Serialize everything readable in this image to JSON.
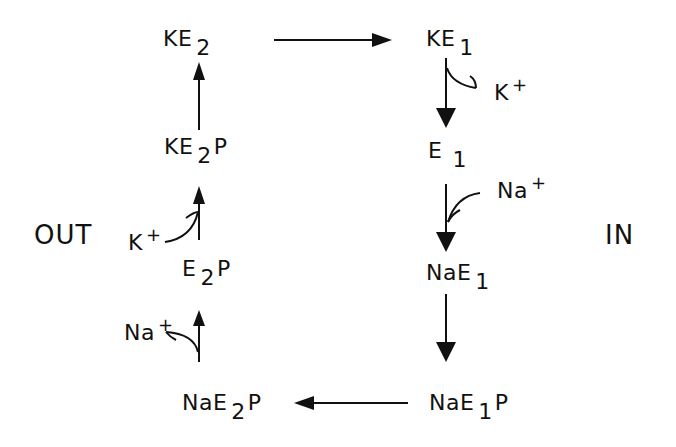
{
  "diagram": {
    "type": "reaction-cycle",
    "compartments": {
      "left": "OUT",
      "right": "IN"
    },
    "states": {
      "ke2": {
        "base": "KE",
        "sub": "2",
        "suffix": ""
      },
      "ke1": {
        "base": "KE",
        "sub": "1",
        "suffix": ""
      },
      "e1": {
        "base": "E",
        "sub": "1",
        "suffix": ""
      },
      "nae1": {
        "base": "NaE",
        "sub": "1",
        "suffix": ""
      },
      "nae1p": {
        "base": "NaE",
        "sub": "1",
        "suffix": "P"
      },
      "nae2p": {
        "base": "NaE",
        "sub": "2",
        "suffix": "P"
      },
      "e2p": {
        "base": "E",
        "sub": "2",
        "suffix": "P"
      },
      "ke2p": {
        "base": "KE",
        "sub": "2",
        "suffix": "P"
      }
    },
    "ions": {
      "k_release_in": {
        "base": "K",
        "sup": "+"
      },
      "na_bind_in": {
        "base": "Na",
        "sup": "+"
      },
      "na_release_out": {
        "base": "Na",
        "sup": "+"
      },
      "k_bind_out": {
        "base": "K",
        "sup": "+"
      }
    },
    "transitions": [
      {
        "from": "KE2",
        "to": "KE1"
      },
      {
        "from": "KE1",
        "to": "E1",
        "ion": "K+ released (IN)"
      },
      {
        "from": "E1",
        "to": "NaE1",
        "ion": "Na+ bound (IN)"
      },
      {
        "from": "NaE1",
        "to": "NaE1P"
      },
      {
        "from": "NaE1P",
        "to": "NaE2P"
      },
      {
        "from": "NaE2P",
        "to": "E2P",
        "ion": "Na+ released (OUT)"
      },
      {
        "from": "E2P",
        "to": "KE2P",
        "ion": "K+ bound (OUT)"
      },
      {
        "from": "KE2P",
        "to": "KE2"
      }
    ],
    "colors": {
      "ink": "#111111",
      "background": "#ffffff"
    }
  }
}
